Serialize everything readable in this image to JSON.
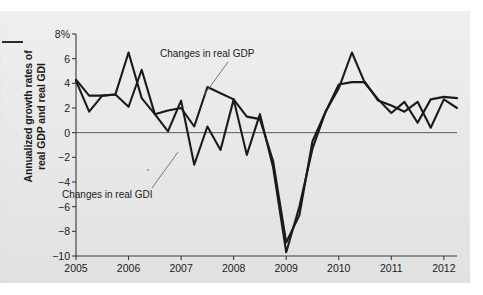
{
  "figure": {
    "y_axis_label_line1": "Annualized growth rates of",
    "y_axis_label_line2": "real GDP and real GDI",
    "edge_mark": "margin-rule"
  },
  "annotations": {
    "gdp_label": "Changes in real GDP",
    "gdi_label": "Changes in real GDI"
  },
  "chart_data": {
    "type": "line",
    "title": "",
    "xlabel": "",
    "ylabel": "Annualized growth rates of real GDP and real GDI",
    "xlim": [
      2005.0,
      2012.25
    ],
    "ylim": [
      -10,
      8
    ],
    "ytick_labels": [
      "8%",
      "6",
      "4",
      "2",
      "0",
      "−2",
      "−4",
      "−6",
      "−8",
      "−10"
    ],
    "ytick_values": [
      8,
      6,
      4,
      2,
      0,
      -2,
      -4,
      -6,
      -8,
      -10
    ],
    "xtick_labels": [
      "2005",
      "2006",
      "2007",
      "2008",
      "2009",
      "2010",
      "2011",
      "2012"
    ],
    "xtick_values": [
      2005,
      2006,
      2007,
      2008,
      2009,
      2010,
      2011,
      2012
    ],
    "grid": false,
    "zero_line": true,
    "legend": "annotated-inline",
    "x": [
      2005.0,
      2005.25,
      2005.5,
      2005.75,
      2006.0,
      2006.25,
      2006.5,
      2006.75,
      2007.0,
      2007.25,
      2007.5,
      2007.75,
      2008.0,
      2008.25,
      2008.5,
      2008.75,
      2009.0,
      2009.25,
      2009.5,
      2009.75,
      2010.0,
      2010.25,
      2010.5,
      2010.75,
      2011.0,
      2011.25,
      2011.5,
      2011.75,
      2012.0,
      2012.25
    ],
    "series": [
      {
        "name": "Changes in real GDP",
        "color": "#1a1a1a",
        "values": [
          4.3,
          3.0,
          3.0,
          3.1,
          2.1,
          5.1,
          1.5,
          1.8,
          2.0,
          0.5,
          3.7,
          3.2,
          2.7,
          1.3,
          1.1,
          -2.3,
          -8.9,
          -6.7,
          -0.7,
          1.7,
          3.9,
          4.1,
          4.1,
          2.6,
          2.2,
          1.7,
          2.5,
          0.4,
          2.7,
          2.0
        ]
      },
      {
        "name": "Changes in real GDI",
        "color": "#1a1a1a",
        "values": [
          4.2,
          1.7,
          3.0,
          3.1,
          6.5,
          2.8,
          1.5,
          0.1,
          2.6,
          -2.6,
          0.5,
          -1.4,
          2.7,
          -1.8,
          1.5,
          -2.8,
          -9.7,
          -6.0,
          -1.3,
          1.7,
          3.6,
          6.5,
          4.0,
          2.7,
          1.6,
          2.5,
          0.8,
          2.7,
          2.9,
          2.8
        ]
      }
    ]
  }
}
